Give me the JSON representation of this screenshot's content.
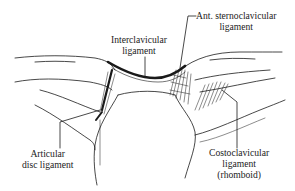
{
  "figure": {
    "background": "#ffffff",
    "ink_color": "#1a1a1a"
  },
  "labels": {
    "interclavicular": {
      "line1": "Interclavicular",
      "line2": "ligament"
    },
    "ant_sternoclavicular": {
      "line1": "Ant. sternoclavicular",
      "line2": "ligament"
    },
    "articular_disc": {
      "line1": "Articular",
      "line2": "disc ligament"
    },
    "costoclavicular": {
      "line1": "Costoclavicular",
      "line2": "ligament",
      "line3": "(rhomboid)"
    }
  }
}
